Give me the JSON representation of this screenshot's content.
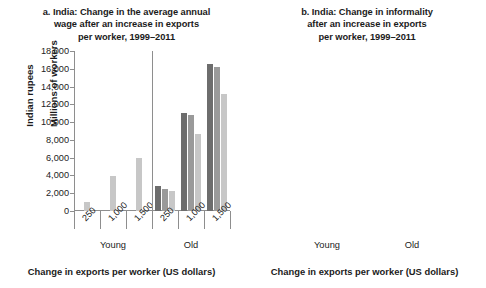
{
  "chart_data": [
    {
      "type": "bar",
      "panel": "a",
      "title": "a. India: Change in the average annual wage after an increase in exports per worker, 1999–2011",
      "title_lines": [
        "a. India: Change in the average annual",
        "wage after an increase in exports",
        "per worker, 1999–2011"
      ],
      "ylabel": "Indian rupees",
      "xlabel": "Change in exports per worker (US dollars)",
      "ylim": [
        0,
        18000
      ],
      "ytick_labels": [
        "18,000",
        "16,000",
        "14,000",
        "12,000",
        "10,000",
        "8,000",
        "6,000",
        "4,000",
        "2,000",
        "0"
      ],
      "ytick_values": [
        18000,
        16000,
        14000,
        12000,
        10000,
        8000,
        6000,
        4000,
        2000,
        0
      ],
      "grid": false,
      "legend": "none",
      "groups": [
        "Young",
        "Old"
      ],
      "categories": [
        "250",
        "1,000",
        "1,500",
        "250",
        "1,000",
        "1,500"
      ],
      "series": [
        {
          "name": "series-1",
          "color": "#6d6d6d",
          "values": [
            null,
            null,
            null,
            2800,
            11000,
            16500
          ]
        },
        {
          "name": "series-2",
          "color": "#9a9a9a",
          "values": [
            null,
            null,
            null,
            2450,
            10750,
            16200
          ]
        },
        {
          "name": "series-3",
          "color": "#c7c7c7",
          "values": [
            1000,
            3950,
            6000,
            2200,
            8700,
            13200
          ]
        }
      ],
      "bars": [
        {
          "group": "Young",
          "category": "250",
          "dark": null,
          "mid": null,
          "light": 1000
        },
        {
          "group": "Young",
          "category": "1,000",
          "dark": null,
          "mid": null,
          "light": 3950
        },
        {
          "group": "Young",
          "category": "1,500",
          "dark": null,
          "mid": null,
          "light": 6000
        },
        {
          "group": "Old",
          "category": "250",
          "dark": 2800,
          "mid": 2450,
          "light": 2200
        },
        {
          "group": "Old",
          "category": "1,000",
          "dark": 11000,
          "mid": 10750,
          "light": 8700
        },
        {
          "group": "Old",
          "category": "1,500",
          "dark": 16500,
          "mid": 16200,
          "light": 13200
        }
      ]
    },
    {
      "type": "bar",
      "panel": "b",
      "title": "b. India: Change in informality after an increase in exports per worker, 1999–2011",
      "title_lines": [
        "b. India: Change in informality",
        "after an increase in exports",
        "per worker, 1999–2011"
      ],
      "ylabel": "Millions of workers",
      "xlabel": "Change in exports per worker (US dollars)",
      "ylim": [
        -8,
        0
      ],
      "ytick_labels": [
        "0",
        "–1",
        "–2",
        "–3",
        "–4",
        "–5",
        "–6",
        "–7",
        "–8"
      ],
      "ytick_values": [
        0,
        -1,
        -2,
        -3,
        -4,
        -5,
        -6,
        -7,
        -8
      ],
      "grid": false,
      "legend": "none",
      "groups": [
        "Young",
        "Old"
      ],
      "categories": [
        "250",
        "1,000",
        "1,500",
        "250",
        "1,000",
        "1,500"
      ],
      "series": [
        {
          "name": "series-1",
          "color": "#6d6d6d",
          "values": [
            -0.85,
            -3.85,
            -5.8,
            -0.75,
            -3.95,
            -6.25
          ]
        },
        {
          "name": "series-2",
          "color": "#9a9a9a",
          "values": [
            -0.8,
            -3.8,
            -5.75,
            -0.7,
            -3.85,
            -6.2
          ]
        },
        {
          "name": "series-3",
          "color": "#c7c7c7",
          "values": [
            -1.1,
            -4.6,
            -7.2,
            -0.95,
            -4.5,
            -6.9
          ]
        }
      ],
      "bars": [
        {
          "group": "Young",
          "category": "250",
          "dark": -0.85,
          "mid": -0.8,
          "light": -1.1
        },
        {
          "group": "Young",
          "category": "1,000",
          "dark": -3.85,
          "mid": -3.8,
          "light": -4.6
        },
        {
          "group": "Young",
          "category": "1,500",
          "dark": -5.8,
          "mid": -5.75,
          "light": -7.2
        },
        {
          "group": "Old",
          "category": "250",
          "dark": -0.75,
          "mid": -0.7,
          "light": -0.95
        },
        {
          "group": "Old",
          "category": "1,000",
          "dark": -3.95,
          "mid": -3.85,
          "light": -4.5
        },
        {
          "group": "Old",
          "category": "1,500",
          "dark": -6.25,
          "mid": -6.2,
          "light": -6.9
        }
      ]
    }
  ],
  "colors": {
    "series_dark": "#6d6d6d",
    "series_mid": "#9a9a9a",
    "series_light": "#c7c7c7",
    "axis": "#8e8e8e",
    "text": "#232323",
    "background": "#ffffff"
  }
}
